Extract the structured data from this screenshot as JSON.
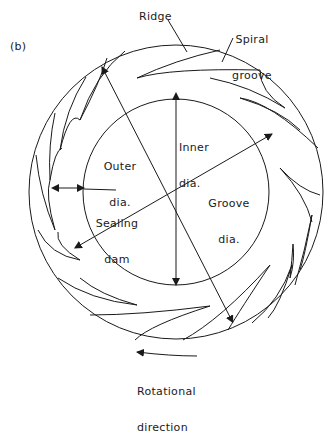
{
  "figure": {
    "panel_label": "(b)",
    "labels": {
      "ridge": "Ridge",
      "spiral_groove_1": "Spiral",
      "spiral_groove_2": "groove",
      "inner_dia_1": "Inner",
      "inner_dia_2": "dia.",
      "outer_dia_1": "Outer",
      "outer_dia_2": "dia.",
      "groove_dia_1": "Groove",
      "groove_dia_2": "dia.",
      "sealing_dam_1": "Sealing",
      "sealing_dam_2": "dam",
      "rotational_1": "Rotational",
      "rotational_2": "direction"
    },
    "geometry": {
      "center": [
        176,
        192
      ],
      "outer_radius": 147,
      "inner_radius": 93,
      "line_color": "#1a1a1a"
    }
  }
}
